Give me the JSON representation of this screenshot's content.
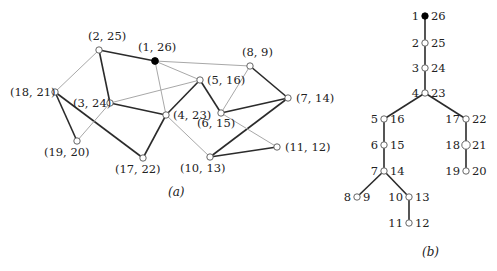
{
  "colors": {
    "dark_edge": "#2b2b2b",
    "light_edge": "#a8a8a8",
    "node_fill": "#ffffff",
    "root_fill": "#000000",
    "node_stroke": "#555555"
  },
  "graph_a": {
    "caption": "(a)",
    "caption_pos": [
      168,
      196
    ],
    "nodes": [
      {
        "id": "n1",
        "label": "(1, 26)",
        "x": 155,
        "y": 61,
        "lx": 138,
        "ly": 51,
        "root": true
      },
      {
        "id": "n2",
        "label": "(2, 25)",
        "x": 99,
        "y": 50,
        "lx": 88,
        "ly": 40
      },
      {
        "id": "n3",
        "label": "(3, 24)",
        "x": 110,
        "y": 103,
        "lx": 73,
        "ly": 107
      },
      {
        "id": "n4",
        "label": "(4, 23)",
        "x": 166,
        "y": 115,
        "lx": 173,
        "ly": 119
      },
      {
        "id": "n5",
        "label": "(5, 16)",
        "x": 200,
        "y": 80,
        "lx": 207,
        "ly": 84
      },
      {
        "id": "n6",
        "label": "(6, 15)",
        "x": 221,
        "y": 113,
        "lx": 197,
        "ly": 127
      },
      {
        "id": "n7",
        "label": "(7, 14)",
        "x": 288,
        "y": 98,
        "lx": 296,
        "ly": 102
      },
      {
        "id": "n8",
        "label": "(8, 9)",
        "x": 250,
        "y": 66,
        "lx": 242,
        "ly": 56
      },
      {
        "id": "n10",
        "label": "(10, 13)",
        "x": 210,
        "y": 157,
        "lx": 180,
        "ly": 172
      },
      {
        "id": "n11",
        "label": "(11, 12)",
        "x": 277,
        "y": 147,
        "lx": 285,
        "ly": 151
      },
      {
        "id": "n17",
        "label": "(17, 22)",
        "x": 143,
        "y": 158,
        "lx": 115,
        "ly": 173
      },
      {
        "id": "n18",
        "label": "(18, 21)",
        "x": 55,
        "y": 92,
        "lx": 10,
        "ly": 96
      },
      {
        "id": "n19",
        "label": "(19, 20)",
        "x": 77,
        "y": 141,
        "lx": 44,
        "ly": 156
      }
    ],
    "edges": [
      {
        "from": "n1",
        "to": "n2",
        "type": "dark"
      },
      {
        "from": "n2",
        "to": "n3",
        "type": "dark"
      },
      {
        "from": "n3",
        "to": "n4",
        "type": "dark"
      },
      {
        "from": "n4",
        "to": "n5",
        "type": "dark"
      },
      {
        "from": "n5",
        "to": "n6",
        "type": "dark"
      },
      {
        "from": "n6",
        "to": "n7",
        "type": "dark"
      },
      {
        "from": "n8",
        "to": "n7",
        "type": "dark"
      },
      {
        "from": "n7",
        "to": "n10",
        "type": "dark"
      },
      {
        "from": "n10",
        "to": "n11",
        "type": "dark"
      },
      {
        "from": "n4",
        "to": "n17",
        "type": "dark"
      },
      {
        "from": "n18",
        "to": "n17",
        "type": "dark"
      },
      {
        "from": "n18",
        "to": "n19",
        "type": "dark"
      },
      {
        "from": "n1",
        "to": "n8",
        "type": "light"
      },
      {
        "from": "n1",
        "to": "n5",
        "type": "light"
      },
      {
        "from": "n1",
        "to": "n4",
        "type": "light"
      },
      {
        "from": "n3",
        "to": "n5",
        "type": "light"
      },
      {
        "from": "n6",
        "to": "n8",
        "type": "light"
      },
      {
        "from": "n4",
        "to": "n10",
        "type": "light"
      },
      {
        "from": "n6",
        "to": "n11",
        "type": "light"
      },
      {
        "from": "n18",
        "to": "n2",
        "type": "light"
      },
      {
        "from": "n3",
        "to": "n19",
        "type": "light"
      }
    ]
  },
  "tree_b": {
    "caption": "(b)",
    "caption_pos": [
      422,
      256
    ],
    "nodes": [
      {
        "id": "t1",
        "left": "1",
        "right": "26",
        "x": 425,
        "y": 16,
        "root": true
      },
      {
        "id": "t2",
        "left": "2",
        "right": "25",
        "x": 425,
        "y": 43
      },
      {
        "id": "t3",
        "left": "3",
        "right": "24",
        "x": 425,
        "y": 68
      },
      {
        "id": "t4",
        "left": "4",
        "right": "23",
        "x": 425,
        "y": 93
      },
      {
        "id": "t5",
        "left": "5",
        "right": "16",
        "x": 384,
        "y": 119
      },
      {
        "id": "t6",
        "left": "6",
        "right": "15",
        "x": 384,
        "y": 145
      },
      {
        "id": "t7",
        "left": "7",
        "right": "14",
        "x": 384,
        "y": 171
      },
      {
        "id": "t8",
        "left": "8",
        "right": "9",
        "x": 357,
        "y": 197
      },
      {
        "id": "t10",
        "left": "10",
        "right": "13",
        "x": 409,
        "y": 197
      },
      {
        "id": "t11",
        "left": "11",
        "right": "12",
        "x": 409,
        "y": 223
      },
      {
        "id": "t17",
        "left": "17",
        "right": "22",
        "x": 466,
        "y": 119
      },
      {
        "id": "t18",
        "left": "18",
        "right": "21",
        "x": 466,
        "y": 145
      },
      {
        "id": "t19",
        "left": "19",
        "right": "20",
        "x": 466,
        "y": 171
      }
    ],
    "edges": [
      [
        "t1",
        "t2"
      ],
      [
        "t2",
        "t3"
      ],
      [
        "t3",
        "t4"
      ],
      [
        "t4",
        "t5"
      ],
      [
        "t5",
        "t6"
      ],
      [
        "t6",
        "t7"
      ],
      [
        "t7",
        "t8"
      ],
      [
        "t7",
        "t10"
      ],
      [
        "t10",
        "t11"
      ],
      [
        "t4",
        "t17"
      ],
      [
        "t17",
        "t18"
      ],
      [
        "t18",
        "t19"
      ]
    ]
  }
}
